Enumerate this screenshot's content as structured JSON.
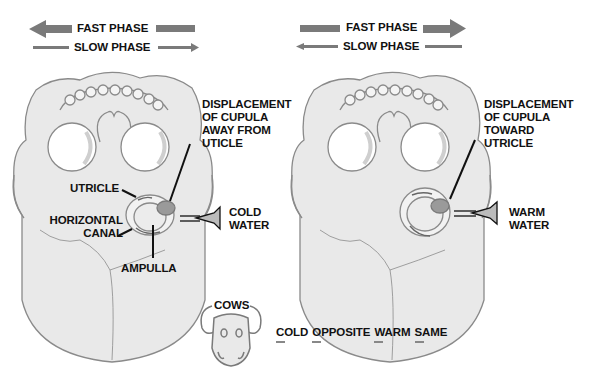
{
  "left_panel": {
    "fast_phase": "FAST PHASE",
    "slow_phase": "SLOW PHASE",
    "fast_direction": "left",
    "slow_direction": "right",
    "displacement": [
      "DISPLACEMENT",
      "OF CUPULA",
      "AWAY FROM",
      "UTICLE"
    ],
    "utricle": "UTRICLE",
    "horizontal_canal": [
      "HORIZONTAL",
      "CANAL"
    ],
    "ampulla": "AMPULLA",
    "water": [
      "COLD",
      "WATER"
    ]
  },
  "right_panel": {
    "fast_phase": "FAST PHASE",
    "slow_phase": "SLOW PHASE",
    "fast_direction": "right",
    "slow_direction": "left",
    "displacement": [
      "DISPLACEMENT",
      "OF CUPULA",
      "TOWARD",
      "UTRICLE"
    ],
    "water": [
      "WARM",
      "WATER"
    ]
  },
  "mnemonic": {
    "title": "COWS",
    "words": [
      "COLD",
      "OPPOSITE",
      "WARM",
      "SAME"
    ]
  },
  "colors": {
    "arrow": "#7a7a7a",
    "skull_fill": "#e9e9e9",
    "skull_stroke": "#8a8a8a",
    "cupula": "#9a9a9a",
    "text": "#111111"
  }
}
